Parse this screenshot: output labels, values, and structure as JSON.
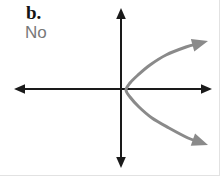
{
  "figure": {
    "width": 220,
    "height": 176,
    "background_color": "#ffffff",
    "border_color": "#e2e2e2"
  },
  "labels": {
    "part_label": "b.",
    "part_label_color": "#141414",
    "answer_label": "No",
    "answer_label_color": "#787878"
  },
  "chart_data": {
    "type": "line",
    "title": "b.",
    "subtitle": "No",
    "annotations": [
      "b.",
      "No"
    ],
    "xlabel": "",
    "ylabel": "",
    "grid": false,
    "legend": null,
    "axes": {
      "color": "#1a1a1a",
      "line_width": 2,
      "origin": [
        121,
        89
      ],
      "x_axis": {
        "from": [
          14,
          89
        ],
        "to": [
          212,
          89
        ],
        "arrows": [
          "start",
          "end"
        ]
      },
      "y_axis": {
        "from": [
          121,
          8
        ],
        "to": [
          121,
          168
        ],
        "arrows": [
          "start",
          "end"
        ]
      },
      "xlim": [
        -107,
        91
      ],
      "ylim": [
        -79,
        81
      ],
      "tick_labels": []
    },
    "series": [
      {
        "name": "sideways-parabola",
        "color": "#8a8a8a",
        "line_width": 3,
        "arrows": [
          "upper-end",
          "lower-end"
        ],
        "vertex": [
          126,
          90
        ],
        "opens": "right",
        "upper_arrow_tip": [
          208,
          41
        ],
        "lower_arrow_tip": [
          208,
          145
        ],
        "points": [
          [
            208,
            41
          ],
          [
            186,
            47
          ],
          [
            166,
            55
          ],
          [
            150,
            65
          ],
          [
            138,
            75
          ],
          [
            130,
            83
          ],
          [
            126,
            90
          ],
          [
            130,
            97
          ],
          [
            139,
            107
          ],
          [
            152,
            118
          ],
          [
            169,
            128
          ],
          [
            188,
            138
          ],
          [
            208,
            145
          ]
        ]
      }
    ]
  }
}
